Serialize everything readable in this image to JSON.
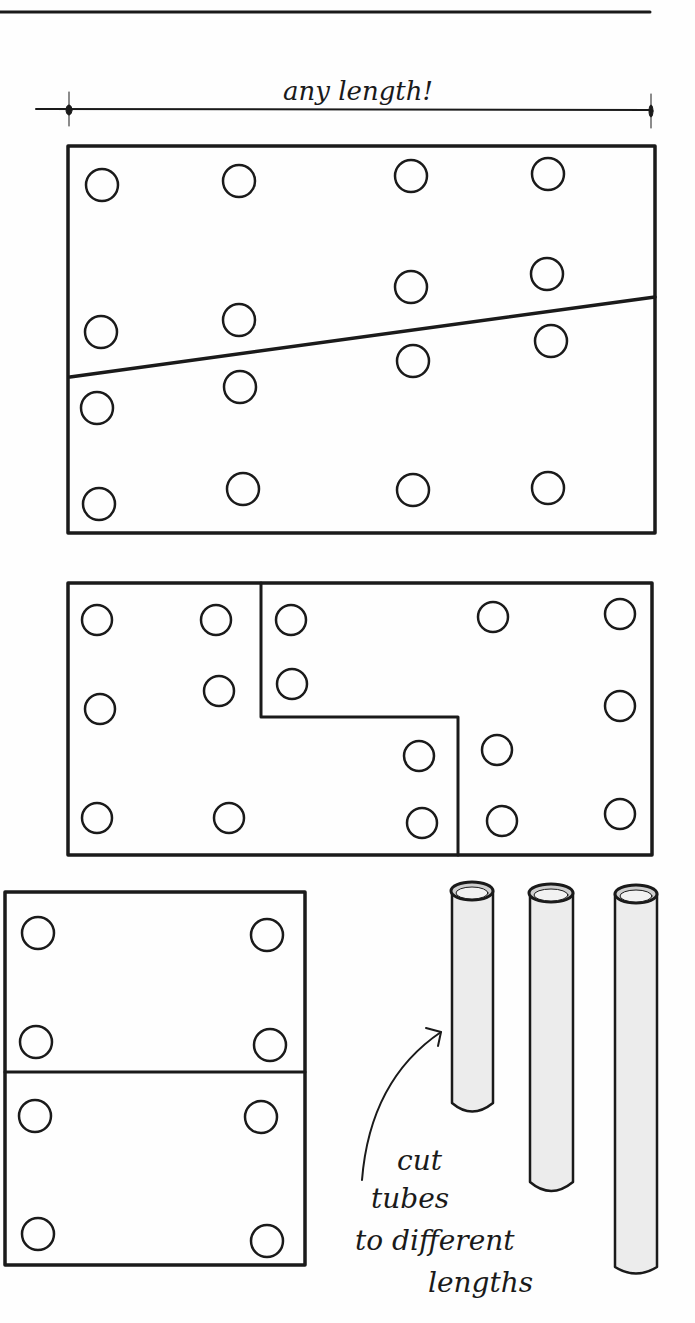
{
  "annotations": {
    "dimension_label": "any length!",
    "tube_note_line1": "cut",
    "tube_note_line2": "tubes",
    "tube_note_line3": "to different",
    "tube_note_line4": "lengths"
  },
  "colors": {
    "ink": "#1a1a1a",
    "paper": "#fefefe",
    "tube_shade": "#e6e6e6"
  },
  "panels": {
    "top": {
      "description": "rectangle board with diagonal cut line",
      "hole_count": 16
    },
    "middle": {
      "description": "rectangle board with stepped cut line",
      "hole_count": 16
    },
    "bottom_left": {
      "description": "rectangle split horizontally into two halves",
      "hole_count": 8
    },
    "tubes": {
      "count": 3,
      "description": "tubes cut to different lengths"
    }
  }
}
